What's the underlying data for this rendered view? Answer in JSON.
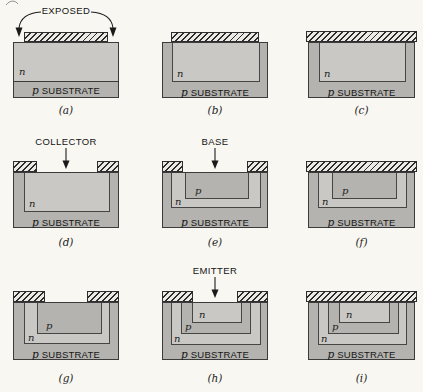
{
  "figure": {
    "colors": {
      "background": "#f8f7f2",
      "n_region": "#c9c8c4",
      "p_region": "#b4b3af",
      "substrate": "#b4b3af",
      "mask_fill": "#eceae5",
      "mask_line": "#2c2c2c",
      "outline": "#3b3b3b"
    }
  },
  "panels": [
    {
      "id": "a",
      "caption": "(a)",
      "top_label": "EXPOSED",
      "n_label": "n",
      "substrate_p": "p",
      "substrate_text": "SUBSTRATE"
    },
    {
      "id": "b",
      "caption": "(b)",
      "n_label": "n",
      "substrate_p": "p",
      "substrate_text": "SUBSTRATE"
    },
    {
      "id": "c",
      "caption": "(c)",
      "n_label": "n",
      "substrate_p": "p",
      "substrate_text": "SUBSTRATE"
    },
    {
      "id": "d",
      "caption": "(d)",
      "top_label": "COLLECTOR",
      "n_label": "n",
      "substrate_p": "p",
      "substrate_text": "SUBSTRATE"
    },
    {
      "id": "e",
      "caption": "(e)",
      "top_label": "BASE",
      "p_label": "p",
      "n_label": "n",
      "substrate_p": "p",
      "substrate_text": "SUBSTRATE"
    },
    {
      "id": "f",
      "caption": "(f)",
      "p_label": "p",
      "n_label": "n",
      "substrate_p": "p",
      "substrate_text": "SUBSTRATE"
    },
    {
      "id": "g",
      "caption": "(g)",
      "p_label": "p",
      "n_label": "n",
      "substrate_p": "p",
      "substrate_text": "SUBSTRATE"
    },
    {
      "id": "h",
      "caption": "(h)",
      "top_label": "EMITTER",
      "emitter_n_label": "n",
      "p_label": "p",
      "n_label": "n",
      "substrate_p": "p",
      "substrate_text": "SUBSTRATE"
    },
    {
      "id": "i",
      "caption": "(i)",
      "emitter_n_label": "n",
      "p_label": "p",
      "n_label": "n",
      "substrate_p": "p",
      "substrate_text": "SUBSTRATE"
    }
  ]
}
